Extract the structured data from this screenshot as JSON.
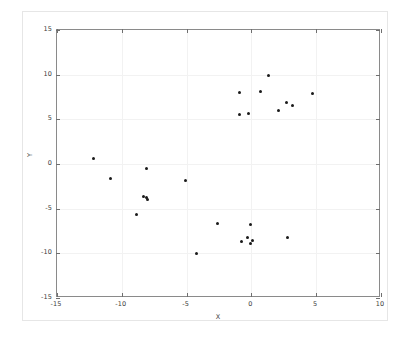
{
  "chart_data": {
    "type": "scatter",
    "title": "",
    "xlabel": "X",
    "ylabel": "Y",
    "xlim": [
      -15,
      10
    ],
    "ylim": [
      -15,
      15
    ],
    "xticks": [
      -15,
      -10,
      -5,
      0,
      5,
      10
    ],
    "yticks": [
      -15,
      -10,
      -5,
      0,
      5,
      10,
      15
    ],
    "xticklabels": [
      "-15",
      "-10",
      "-5",
      "0",
      "5",
      "10"
    ],
    "yticklabels": [
      "-15",
      "-10",
      "-5",
      "0",
      "5",
      "10",
      "15"
    ],
    "grid": true,
    "legend": null,
    "marker_color": "#1a1a1a",
    "marker_size": 3,
    "series": [
      {
        "name": "points",
        "points": [
          [
            -12.2,
            0.6
          ],
          [
            -10.9,
            -1.6
          ],
          [
            -8.9,
            -5.7
          ],
          [
            -8.3,
            -3.6
          ],
          [
            -8.1,
            -3.7
          ],
          [
            -8.0,
            -4.0
          ],
          [
            -8.1,
            -0.5
          ],
          [
            -5.1,
            -1.8
          ],
          [
            -4.2,
            -10.0
          ],
          [
            -2.6,
            -6.7
          ],
          [
            -0.9,
            5.5
          ],
          [
            -0.9,
            8.0
          ],
          [
            -0.2,
            5.7
          ],
          [
            -0.8,
            -8.7
          ],
          [
            -0.3,
            -8.2
          ],
          [
            -0.1,
            -8.9
          ],
          [
            0.1,
            -8.6
          ],
          [
            -0.1,
            -6.8
          ],
          [
            0.7,
            8.1
          ],
          [
            1.3,
            9.9
          ],
          [
            2.1,
            6.0
          ],
          [
            2.7,
            6.9
          ],
          [
            2.8,
            -8.2
          ],
          [
            3.2,
            6.5
          ],
          [
            4.7,
            7.9
          ]
        ]
      }
    ]
  },
  "colors": {
    "axis": "#8a8a8a",
    "grid": "#f2f2f2",
    "figure_border": "#e6e6e6",
    "text": "#3b3b3b",
    "marker": "#1a1a1a",
    "background": "#ffffff"
  }
}
